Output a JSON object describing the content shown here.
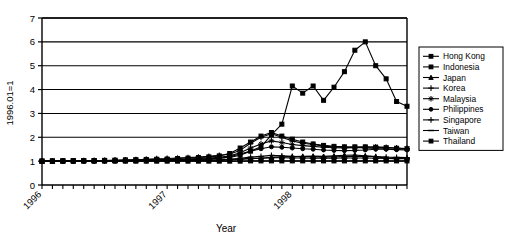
{
  "chart_data": {
    "type": "line",
    "title": "",
    "xlabel": "Year",
    "ylabel": "1996.01=1",
    "ylim": [
      0,
      7
    ],
    "yticks": [
      0,
      1,
      2,
      3,
      4,
      5,
      6,
      7
    ],
    "grid": "horizontal",
    "legend_position": "right",
    "x_tick_labels": [
      "1996",
      "1997",
      "1998"
    ],
    "x_tick_label_positions": [
      0,
      12,
      24
    ],
    "x_minor_tick_count": 36,
    "x": [
      "1996.01",
      "1996.02",
      "1996.03",
      "1996.04",
      "1996.05",
      "1996.06",
      "1996.07",
      "1996.08",
      "1996.09",
      "1996.10",
      "1996.11",
      "1996.12",
      "1997.01",
      "1997.02",
      "1997.03",
      "1997.04",
      "1997.05",
      "1997.06",
      "1997.07",
      "1997.08",
      "1997.09",
      "1997.10",
      "1997.11",
      "1997.12",
      "1998.01",
      "1998.02",
      "1998.03",
      "1998.04",
      "1998.05",
      "1998.06",
      "1998.07",
      "1998.08",
      "1998.09",
      "1998.10",
      "1998.11",
      "1998.12"
    ],
    "series": [
      {
        "name": "Hong Kong",
        "marker": "square",
        "values": [
          1.0,
          1.0,
          1.0,
          1.0,
          1.0,
          1.0,
          1.0,
          1.0,
          1.0,
          1.0,
          1.0,
          1.0,
          1.0,
          1.0,
          1.0,
          1.0,
          1.0,
          1.0,
          1.0,
          1.0,
          1.01,
          1.01,
          1.01,
          1.01,
          1.01,
          1.01,
          1.01,
          1.01,
          1.01,
          1.01,
          1.01,
          1.01,
          1.01,
          1.01,
          1.01,
          1.01
        ]
      },
      {
        "name": "Indonesia",
        "marker": "square",
        "values": [
          1.0,
          1.01,
          1.01,
          1.02,
          1.02,
          1.02,
          1.03,
          1.03,
          1.04,
          1.04,
          1.05,
          1.05,
          1.06,
          1.07,
          1.08,
          1.09,
          1.1,
          1.12,
          1.15,
          1.25,
          1.42,
          1.6,
          2.1,
          2.55,
          4.15,
          3.85,
          4.15,
          3.55,
          4.1,
          4.75,
          5.65,
          6.0,
          5.0,
          4.45,
          3.5,
          3.3
        ]
      },
      {
        "name": "Japan",
        "marker": "triangle",
        "values": [
          1.0,
          1.0,
          1.01,
          1.01,
          1.02,
          1.02,
          1.02,
          1.03,
          1.03,
          1.04,
          1.05,
          1.06,
          1.06,
          1.05,
          1.05,
          1.06,
          1.06,
          1.05,
          1.07,
          1.09,
          1.12,
          1.12,
          1.16,
          1.18,
          1.19,
          1.2,
          1.21,
          1.2,
          1.22,
          1.25,
          1.26,
          1.22,
          1.19,
          1.12,
          1.1,
          1.12
        ]
      },
      {
        "name": "Korea",
        "marker": "cross",
        "values": [
          1.0,
          1.0,
          1.01,
          1.01,
          1.02,
          1.02,
          1.03,
          1.04,
          1.05,
          1.06,
          1.08,
          1.1,
          1.11,
          1.13,
          1.15,
          1.17,
          1.2,
          1.24,
          1.3,
          1.45,
          1.75,
          2.0,
          2.15,
          2.0,
          1.85,
          1.75,
          1.7,
          1.63,
          1.6,
          1.58,
          1.57,
          1.55,
          1.53,
          1.52,
          1.5,
          1.5
        ]
      },
      {
        "name": "Malaysia",
        "marker": "star",
        "values": [
          1.0,
          1.0,
          1.01,
          1.01,
          1.01,
          1.02,
          1.02,
          1.03,
          1.03,
          1.04,
          1.05,
          1.06,
          1.07,
          1.08,
          1.09,
          1.11,
          1.13,
          1.16,
          1.22,
          1.35,
          1.55,
          1.72,
          1.85,
          1.78,
          1.7,
          1.65,
          1.62,
          1.58,
          1.56,
          1.55,
          1.56,
          1.58,
          1.6,
          1.58,
          1.55,
          1.53
        ]
      },
      {
        "name": "Philippines",
        "marker": "circle",
        "values": [
          1.0,
          1.0,
          1.0,
          1.01,
          1.01,
          1.01,
          1.02,
          1.02,
          1.03,
          1.03,
          1.04,
          1.05,
          1.05,
          1.06,
          1.07,
          1.08,
          1.1,
          1.12,
          1.18,
          1.3,
          1.42,
          1.52,
          1.6,
          1.58,
          1.55,
          1.52,
          1.5,
          1.47,
          1.45,
          1.44,
          1.45,
          1.47,
          1.5,
          1.5,
          1.48,
          1.47
        ]
      },
      {
        "name": "Singapore",
        "marker": "plus",
        "values": [
          1.0,
          1.0,
          1.0,
          1.0,
          1.01,
          1.01,
          1.01,
          1.01,
          1.02,
          1.02,
          1.02,
          1.03,
          1.03,
          1.04,
          1.04,
          1.05,
          1.05,
          1.06,
          1.08,
          1.12,
          1.17,
          1.2,
          1.24,
          1.22,
          1.2,
          1.19,
          1.18,
          1.17,
          1.18,
          1.19,
          1.2,
          1.2,
          1.19,
          1.17,
          1.16,
          1.15
        ]
      },
      {
        "name": "Taiwan",
        "marker": "dash",
        "values": [
          1.0,
          1.0,
          1.0,
          1.0,
          1.0,
          1.01,
          1.01,
          1.01,
          1.01,
          1.02,
          1.02,
          1.02,
          1.02,
          1.03,
          1.03,
          1.03,
          1.04,
          1.04,
          1.05,
          1.07,
          1.1,
          1.12,
          1.14,
          1.14,
          1.13,
          1.13,
          1.12,
          1.12,
          1.12,
          1.13,
          1.13,
          1.13,
          1.12,
          1.11,
          1.1,
          1.1
        ]
      },
      {
        "name": "Thailand",
        "marker": "square",
        "values": [
          1.0,
          1.0,
          1.01,
          1.01,
          1.02,
          1.02,
          1.03,
          1.04,
          1.05,
          1.06,
          1.07,
          1.08,
          1.09,
          1.11,
          1.13,
          1.15,
          1.18,
          1.22,
          1.32,
          1.55,
          1.8,
          2.05,
          2.2,
          2.05,
          1.92,
          1.8,
          1.72,
          1.66,
          1.62,
          1.6,
          1.6,
          1.6,
          1.58,
          1.56,
          1.54,
          1.52
        ]
      }
    ]
  },
  "legend": {
    "items": [
      {
        "label": "Hong Kong"
      },
      {
        "label": "Indonesia"
      },
      {
        "label": "Japan"
      },
      {
        "label": "Korea"
      },
      {
        "label": "Malaysia"
      },
      {
        "label": "Philippines"
      },
      {
        "label": "Singapore"
      },
      {
        "label": "Taiwan"
      },
      {
        "label": "Thailand"
      }
    ]
  },
  "colors": {
    "line": "#000000",
    "axis": "#000000",
    "grid": "#000000",
    "background": "#ffffff"
  }
}
